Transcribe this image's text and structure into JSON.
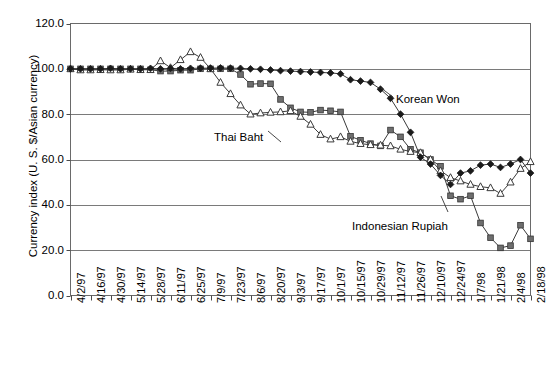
{
  "chart_data": {
    "type": "line",
    "title": "",
    "xlabel": "",
    "ylabel": "Currency index (U. S. $/Asian currency)",
    "ylim": [
      0.0,
      120.0
    ],
    "yticks": [
      "0.0",
      "20.0",
      "40.0",
      "60.0",
      "80.0",
      "100.0",
      "120.0"
    ],
    "ytick_values": [
      0,
      20,
      40,
      60,
      80,
      100,
      120
    ],
    "grid": "horizontal",
    "legend_position": "inline-annotations",
    "annotations": [
      {
        "text": "Korean Won",
        "series": "Korean Won",
        "x_px": 396,
        "y_px": 93
      },
      {
        "text": "Thai Baht",
        "series": "Thai Baht",
        "x_px": 214,
        "y_px": 131
      },
      {
        "text": "Indonesian Rupiah",
        "series": "Indonesian Rupiah",
        "x_px": 352,
        "y_px": 220
      }
    ],
    "tick_labels": [
      "4/2/97",
      "4/16/97",
      "4/30/97",
      "5/14/97",
      "5/28/97",
      "6/11/97",
      "6/25/97",
      "7/9/97",
      "7/23/97",
      "8/6/97",
      "8/20/97",
      "9/3/97",
      "9/17/97",
      "10/1/97",
      "10/15/97",
      "10/29/97",
      "11/12/97",
      "11/26/97",
      "12/10/97",
      "12/24/97",
      "1/7/98",
      "1/21/98",
      "2/4/98",
      "2/18/98"
    ],
    "x": [
      "4/2/97",
      "4/9/97",
      "4/16/97",
      "4/23/97",
      "4/30/97",
      "5/7/97",
      "5/14/97",
      "5/21/97",
      "5/28/97",
      "6/4/97",
      "6/11/97",
      "6/18/97",
      "6/25/97",
      "7/2/97",
      "7/9/97",
      "7/16/97",
      "7/23/97",
      "7/30/97",
      "8/6/97",
      "8/13/97",
      "8/20/97",
      "8/27/97",
      "9/3/97",
      "9/10/97",
      "9/17/97",
      "9/24/97",
      "10/1/97",
      "10/8/97",
      "10/15/97",
      "10/22/97",
      "10/29/97",
      "11/5/97",
      "11/12/97",
      "11/19/97",
      "11/26/97",
      "12/3/97",
      "12/10/97",
      "12/17/97",
      "12/24/97",
      "12/31/97",
      "1/7/98",
      "1/14/98",
      "1/21/98",
      "1/28/98",
      "2/4/98",
      "2/11/98",
      "2/18/98"
    ],
    "series": [
      {
        "name": "Korean Won",
        "marker": "filled-diamond",
        "color": "#1a1a1a",
        "values": [
          100.0,
          100.0,
          100.0,
          100.0,
          100.2,
          100.0,
          100.0,
          100.0,
          100.2,
          100.0,
          100.2,
          100.0,
          100.2,
          100.3,
          100.3,
          100.4,
          100.3,
          100.2,
          100.0,
          99.8,
          99.5,
          99.2,
          99.0,
          98.8,
          98.6,
          98.4,
          98.2,
          97.8,
          95.2,
          94.6,
          94.0,
          91.0,
          87.0,
          80.0,
          72.0,
          61.0,
          58.0,
          53.0,
          49.0,
          54.0,
          55.0,
          57.5,
          58.0,
          56.5,
          58.0,
          60.0,
          54.0
        ]
      },
      {
        "name": "Indonesian Rupiah",
        "marker": "filled-square",
        "color": "#6e6e6e",
        "values": [
          100.0,
          100.0,
          100.0,
          100.0,
          100.0,
          100.0,
          100.0,
          100.0,
          99.6,
          99.0,
          99.0,
          99.4,
          99.4,
          100.0,
          100.0,
          100.0,
          100.0,
          97.5,
          93.2,
          93.5,
          93.4,
          86.5,
          82.8,
          81.0,
          80.8,
          81.8,
          81.5,
          81.0,
          70.2,
          68.5,
          67.0,
          66.0,
          73.0,
          70.0,
          64.5,
          63.0,
          60.0,
          57.0,
          44.0,
          42.5,
          44.0,
          32.0,
          25.5,
          21.0,
          22.0,
          31.0,
          25.0
        ]
      },
      {
        "name": "Thai Baht",
        "marker": "open-triangle",
        "color": "#3a3a3a",
        "values": [
          100.0,
          99.5,
          99.5,
          99.6,
          99.5,
          99.5,
          99.8,
          99.6,
          99.6,
          103.5,
          100.5,
          104.0,
          107.5,
          105.0,
          100.0,
          94.0,
          89.0,
          84.0,
          80.0,
          80.5,
          80.8,
          81.0,
          81.5,
          79.0,
          75.5,
          71.0,
          69.0,
          70.0,
          68.0,
          67.0,
          66.5,
          66.3,
          66.0,
          64.5,
          63.5,
          63.0,
          60.0,
          55.0,
          52.0,
          50.5,
          49.0,
          48.0,
          47.5,
          45.0,
          50.0,
          56.0,
          59.0
        ]
      }
    ]
  }
}
